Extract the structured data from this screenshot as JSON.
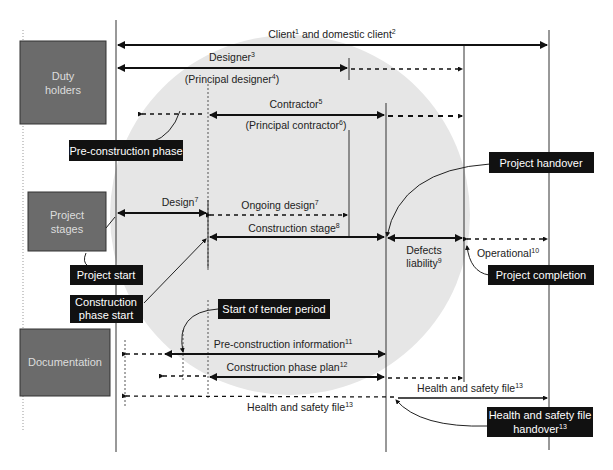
{
  "categories": {
    "duty_holders": "Duty holders",
    "duty_holders_l1": "Duty",
    "duty_holders_l2": "holders",
    "project_stages_l1": "Project",
    "project_stages_l2": "stages",
    "documentation": "Documentation"
  },
  "duty_holders": {
    "client": "Client",
    "client_sup": "1",
    "domestic": " and domestic client",
    "domestic_sup": "2",
    "designer": "Designer",
    "designer_sup": "3",
    "principal_designer": "(Principal designer",
    "principal_designer_sup": "4",
    "contractor": "Contractor",
    "contractor_sup": "5",
    "principal_contractor": "(Principal contractor",
    "principal_contractor_sup": "6"
  },
  "stages": {
    "design": "Design",
    "design_sup": "7",
    "ongoing_design": "Ongoing design",
    "ongoing_design_sup": "7",
    "construction_stage": "Construction stage",
    "construction_stage_sup": "8",
    "defects_l1": "Defects",
    "defects_l2": "liability",
    "defects_sup": "9",
    "operational": "Operational",
    "operational_sup": "10"
  },
  "documents": {
    "pci": "Pre-construction information",
    "pci_sup": "11",
    "cpp": "Construction phase plan",
    "cpp_sup": "12",
    "hsf": "Health and safety file",
    "hsf_sup": "13"
  },
  "callouts": {
    "pre_construction_phase": "Pre-construction phase",
    "project_handover": "Project handover",
    "project_start": "Project start",
    "construction_phase_start_l1": "Construction",
    "construction_phase_start_l2": "phase start",
    "project_completion": "Project completion",
    "start_of_tender": "Start of tender period",
    "hsf_handover_l1": "Health and safety file",
    "hsf_handover_l2": "handover",
    "hsf_handover_sup": "13"
  },
  "colors": {
    "category_box": "#6b6b6b",
    "callout_box": "#111111",
    "circle": "#e6e6e6",
    "line": "#111111"
  }
}
